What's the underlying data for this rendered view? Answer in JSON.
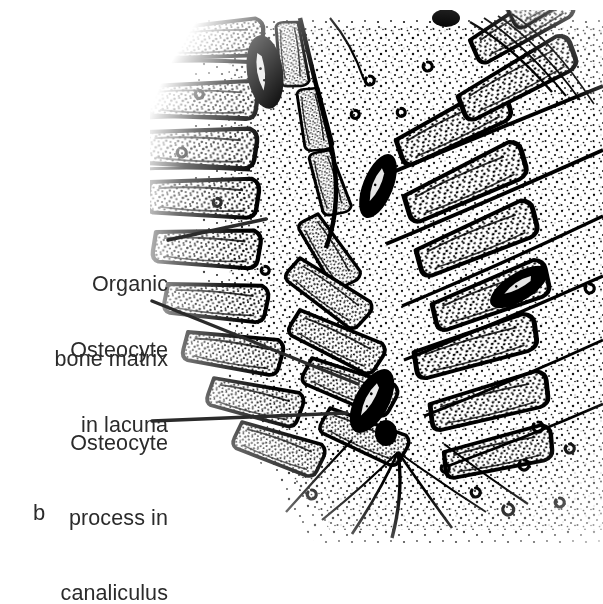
{
  "figure": {
    "letter": "b",
    "caption_letter_name": "panel-b",
    "background_color": "#ffffff",
    "ink_color": "#000000",
    "text_color": "#2b2b2b"
  },
  "labels": [
    {
      "name": "organic-bone-matrix",
      "lines": [
        "Organic",
        "bone matrix"
      ],
      "line1": "Organic",
      "line2": "bone matrix",
      "leader": {
        "x1": 168,
        "y1": 240,
        "x2": 266,
        "y2": 219
      }
    },
    {
      "name": "osteocyte-in-lacuna",
      "lines": [
        "Osteocyte",
        "in lacuna"
      ],
      "line1": "Osteocyte",
      "line2": "in lacuna",
      "leader": {
        "x1": 152,
        "y1": 301,
        "x2": 358,
        "y2": 384
      }
    },
    {
      "name": "osteocyte-process-in-canaliculus",
      "lines": [
        "Osteocyte",
        "process in",
        "canaliculus"
      ],
      "line1": "Osteocyte",
      "line2": "process in",
      "line3": "canaliculus",
      "leader": {
        "x1": 152,
        "y1": 421,
        "x2": 347,
        "y2": 413
      }
    }
  ],
  "structures": {
    "lacunae": [
      {
        "name": "lacuna-upper-left",
        "cx": 265,
        "cy": 72,
        "rx": 17,
        "ry": 36,
        "rotate": -8
      },
      {
        "name": "lacuna-mid",
        "cx": 378,
        "cy": 186,
        "rx": 15,
        "ry": 33,
        "rotate": 22
      },
      {
        "name": "lacuna-right",
        "cx": 519,
        "cy": 287,
        "rx": 14,
        "ry": 31,
        "rotate": 58
      },
      {
        "name": "lacuna-lower-left",
        "cx": 372,
        "cy": 401,
        "rx": 16,
        "ry": 34,
        "rotate": 28
      },
      {
        "name": "lacuna-bottom",
        "cx": 386,
        "cy": 432,
        "rx": 10,
        "ry": 13,
        "rotate": 0
      }
    ],
    "notes": "stippled organic bone matrix with lamellar bands and canaliculi"
  }
}
